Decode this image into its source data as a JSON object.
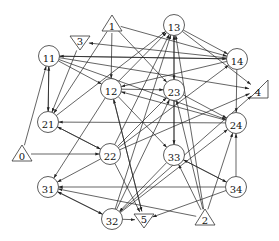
{
  "diagram": {
    "type": "directed-graph",
    "nodes": [
      {
        "id": "0",
        "label": "0",
        "shape": "triangle-up",
        "x": 22,
        "y": 154
      },
      {
        "id": "1",
        "label": "1",
        "shape": "triangle-up",
        "x": 112,
        "y": 24
      },
      {
        "id": "2",
        "label": "2",
        "shape": "triangle-up",
        "x": 205,
        "y": 218
      },
      {
        "id": "3",
        "label": "3",
        "shape": "triangle-down",
        "x": 80,
        "y": 42
      },
      {
        "id": "4",
        "label": "4",
        "shape": "triangle-right",
        "x": 258,
        "y": 90
      },
      {
        "id": "5",
        "label": "5",
        "shape": "triangle-down",
        "x": 144,
        "y": 220
      },
      {
        "id": "11",
        "label": "11",
        "shape": "circle",
        "x": 49,
        "y": 56
      },
      {
        "id": "12",
        "label": "12",
        "shape": "circle",
        "x": 111,
        "y": 89
      },
      {
        "id": "13",
        "label": "13",
        "shape": "circle",
        "x": 174,
        "y": 25
      },
      {
        "id": "14",
        "label": "14",
        "shape": "circle",
        "x": 237,
        "y": 59
      },
      {
        "id": "21",
        "label": "21",
        "shape": "circle",
        "x": 48,
        "y": 122
      },
      {
        "id": "22",
        "label": "22",
        "shape": "circle",
        "x": 110,
        "y": 154
      },
      {
        "id": "23",
        "label": "23",
        "shape": "circle",
        "x": 174,
        "y": 90
      },
      {
        "id": "24",
        "label": "24",
        "shape": "circle",
        "x": 236,
        "y": 123
      },
      {
        "id": "31",
        "label": "31",
        "shape": "circle",
        "x": 48,
        "y": 187
      },
      {
        "id": "32",
        "label": "32",
        "shape": "circle",
        "x": 112,
        "y": 219
      },
      {
        "id": "33",
        "label": "33",
        "shape": "circle",
        "x": 174,
        "y": 155
      },
      {
        "id": "34",
        "label": "34",
        "shape": "circle",
        "x": 236,
        "y": 187
      }
    ],
    "edges": [
      {
        "from": "1",
        "to": "12"
      },
      {
        "from": "1",
        "to": "21"
      },
      {
        "from": "1",
        "to": "14"
      },
      {
        "from": "1",
        "to": "23"
      },
      {
        "from": "3",
        "to": "21"
      },
      {
        "from": "14",
        "to": "3"
      },
      {
        "from": "11",
        "to": "21"
      },
      {
        "from": "21",
        "to": "11"
      },
      {
        "from": "11",
        "to": "12"
      },
      {
        "from": "11",
        "to": "14"
      },
      {
        "from": "14",
        "to": "11"
      },
      {
        "from": "11",
        "to": "4"
      },
      {
        "from": "11",
        "to": "24"
      },
      {
        "from": "13",
        "to": "14"
      },
      {
        "from": "13",
        "to": "4"
      },
      {
        "from": "13",
        "to": "23"
      },
      {
        "from": "12",
        "to": "13"
      },
      {
        "from": "21",
        "to": "13"
      },
      {
        "from": "22",
        "to": "13"
      },
      {
        "from": "33",
        "to": "13"
      },
      {
        "from": "32",
        "to": "13"
      },
      {
        "from": "2",
        "to": "13"
      },
      {
        "from": "12",
        "to": "23"
      },
      {
        "from": "24",
        "to": "12"
      },
      {
        "from": "14",
        "to": "12"
      },
      {
        "from": "12",
        "to": "31"
      },
      {
        "from": "12",
        "to": "33"
      },
      {
        "from": "12",
        "to": "5"
      },
      {
        "from": "5",
        "to": "12"
      },
      {
        "from": "23",
        "to": "33"
      },
      {
        "from": "23",
        "to": "24"
      },
      {
        "from": "22",
        "to": "23"
      },
      {
        "from": "32",
        "to": "23"
      },
      {
        "from": "2",
        "to": "23"
      },
      {
        "from": "14",
        "to": "24"
      },
      {
        "from": "22",
        "to": "14"
      },
      {
        "from": "21",
        "to": "22"
      },
      {
        "from": "22",
        "to": "21"
      },
      {
        "from": "24",
        "to": "21"
      },
      {
        "from": "0",
        "to": "11"
      },
      {
        "from": "0",
        "to": "22"
      },
      {
        "from": "22",
        "to": "4"
      },
      {
        "from": "22",
        "to": "31"
      },
      {
        "from": "22",
        "to": "5"
      },
      {
        "from": "33",
        "to": "34"
      },
      {
        "from": "34",
        "to": "33"
      },
      {
        "from": "2",
        "to": "33"
      },
      {
        "from": "33",
        "to": "32"
      },
      {
        "from": "32",
        "to": "24"
      },
      {
        "from": "34",
        "to": "24"
      },
      {
        "from": "2",
        "to": "24"
      },
      {
        "from": "34",
        "to": "31"
      },
      {
        "from": "2",
        "to": "31"
      },
      {
        "from": "31",
        "to": "32"
      },
      {
        "from": "32",
        "to": "31"
      },
      {
        "from": "32",
        "to": "5"
      },
      {
        "from": "34",
        "to": "5"
      },
      {
        "from": "32",
        "to": "4"
      }
    ]
  }
}
